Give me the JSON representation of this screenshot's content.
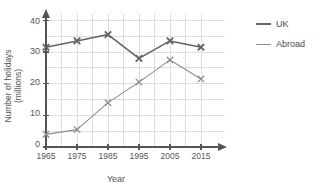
{
  "chart_data": {
    "type": "line",
    "title": "",
    "xlabel": "Year",
    "ylabel": "Number of holidays (millions)",
    "ylabel_line1": "Number of holidays",
    "ylabel_line2": "(millions)",
    "x": [
      1965,
      1975,
      1985,
      1995,
      2005,
      2015
    ],
    "categories": [
      "1965",
      "1975",
      "1985",
      "1995",
      "2005",
      "2015"
    ],
    "xlim": [
      1960,
      2020
    ],
    "ylim": [
      0,
      42
    ],
    "yticks": [
      0,
      10,
      20,
      30,
      40
    ],
    "ytick_labels": [
      "0",
      "10",
      "20",
      "30",
      "40"
    ],
    "y_minor_step": 5,
    "grid": true,
    "marker": "x",
    "legend_position": "right-outside",
    "series": [
      {
        "name": "UK",
        "color": "#646464",
        "line_width": 1.6,
        "values": [
          31.5,
          33.5,
          35.5,
          28.0,
          33.5,
          31.5
        ]
      },
      {
        "name": "Abroad",
        "color": "#8e8e8e",
        "line_width": 1.1,
        "values": [
          4.0,
          5.5,
          14.0,
          20.5,
          27.5,
          21.5
        ]
      }
    ]
  },
  "legend": {
    "items": [
      {
        "label": "UK",
        "swatch": "uk-line-swatch"
      },
      {
        "label": "Abroad",
        "swatch": "abroad-line-swatch"
      }
    ]
  },
  "axes": {
    "x_title": "Year",
    "y_title_line1": "Number of holidays",
    "y_title_line2": "(millions)",
    "y_tick_labels": [
      "40",
      "30",
      "20",
      "10",
      "0"
    ],
    "x_tick_labels": [
      "1965",
      "1975",
      "1985",
      "1995",
      "2005",
      "2015"
    ]
  },
  "colors": {
    "uk": "#646464",
    "abroad": "#8e8e8e",
    "grid": "#d6d6d6",
    "axis": "#555555",
    "text": "#4a4a4a",
    "background": "#ffffff"
  },
  "artifacts": {
    "top_fragment": ""
  }
}
